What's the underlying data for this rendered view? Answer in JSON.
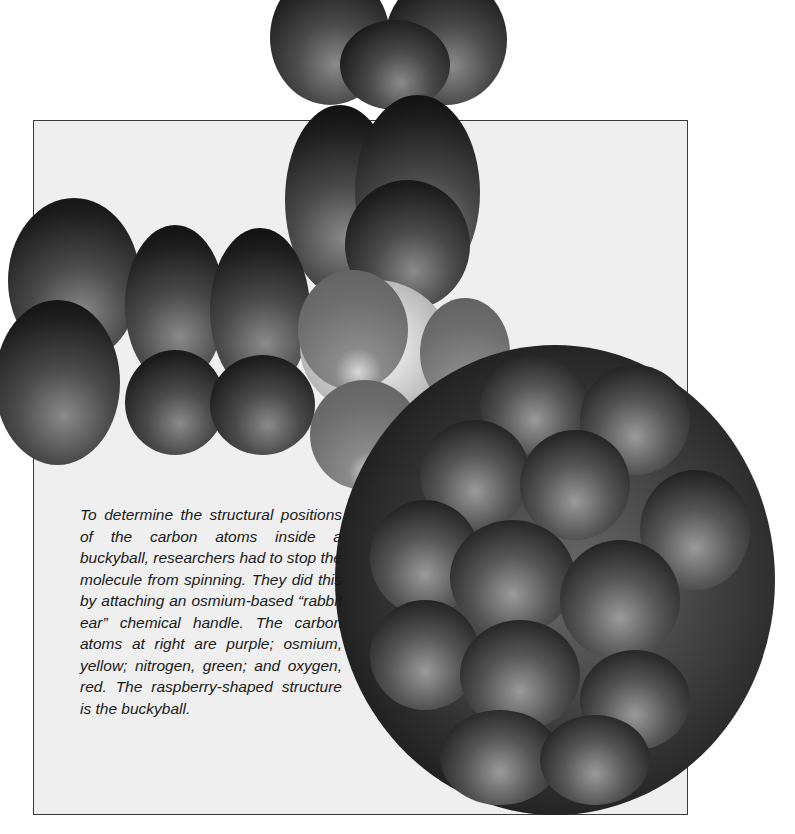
{
  "figure": {
    "colors": {
      "page_background": "#ffffff",
      "frame_background": "#efefef",
      "frame_border": "#3a3a3a",
      "caption_text": "#1a1a1a"
    },
    "atoms_legend": [
      {
        "element": "carbon",
        "color_name": "purple"
      },
      {
        "element": "osmium",
        "color_name": "yellow"
      },
      {
        "element": "nitrogen",
        "color_name": "green"
      },
      {
        "element": "oxygen",
        "color_name": "red"
      }
    ]
  },
  "caption": {
    "text": "To determine the structural positions of the carbon atoms inside a buckyball, re­searchers had to stop the molecule from spinning. They did this by attaching an osmium-based “rabbit ear” chemical handle. The carbon atoms at right are purple; os­mium, yellow; nitrogen, green; and oxygen, red. The raspberry-shaped structure is the buckyball."
  }
}
